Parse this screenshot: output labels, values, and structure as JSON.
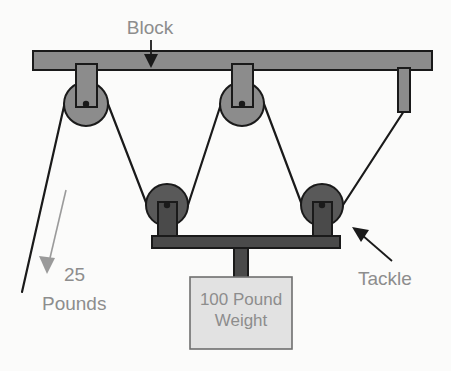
{
  "diagram": {
    "background_color": "#fbfbfa",
    "labels": {
      "block": "Block",
      "tackle": "Tackle",
      "force_value": "25",
      "force_unit": "Pounds",
      "weight_line1": "100 Pound",
      "weight_line2": "Weight"
    },
    "colors": {
      "beam_fill": "#8c8c8c",
      "beam_stroke": "#1a1a1a",
      "upper_pulley_fill": "#8c8c8c",
      "lower_pulley_fill": "#595959",
      "pulley_stroke": "#1a1a1a",
      "bracket_fill": "#8c8c8c",
      "lower_bracket_fill": "#4a4a4a",
      "rope_color": "#1a1a1a",
      "weight_box_fill": "#e2e2e2",
      "weight_box_stroke": "#6f6f6f",
      "text_gray": "#8d8d8d",
      "arrow_black": "#1a1a1a",
      "arrow_gray": "#9a9a9a"
    },
    "parts": {
      "upper_beam_name": "Block",
      "lower_beam_name": "Tackle",
      "upper_pulley_count": 2,
      "lower_pulley_count": 2,
      "mechanical_advantage": 4,
      "load_pounds": 100,
      "effort_pounds": 25
    }
  }
}
